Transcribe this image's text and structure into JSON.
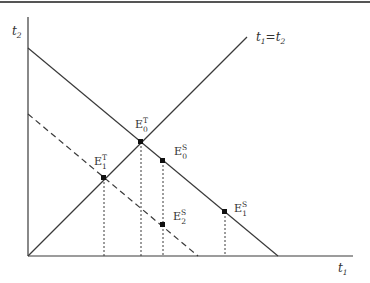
{
  "figure": {
    "type": "economic-diagram",
    "colors": {
      "line": "#3a3a3a",
      "border": "#555555",
      "background": "#ffffff"
    },
    "axes": {
      "x_label": {
        "base": "t",
        "sub": "1"
      },
      "y_label": {
        "base": "t",
        "sub": "2"
      }
    },
    "lines": [
      {
        "id": "diagonal",
        "label_left": {
          "base": "t",
          "sub": "1"
        },
        "label_eq": "=",
        "label_right": {
          "base": "t",
          "sub": "2"
        },
        "style": "solid"
      },
      {
        "id": "budget-line-0",
        "style": "solid"
      },
      {
        "id": "budget-line-1",
        "style": "dashed"
      }
    ],
    "points": [
      {
        "id": "E0T",
        "base": "E",
        "sup": "T",
        "sub": "0"
      },
      {
        "id": "E1T",
        "base": "E",
        "sup": "T",
        "sub": "1"
      },
      {
        "id": "E0S",
        "base": "E",
        "sup": "S",
        "sub": "0"
      },
      {
        "id": "E2S",
        "base": "E",
        "sup": "S",
        "sub": "2"
      },
      {
        "id": "E1S",
        "base": "E",
        "sup": "S",
        "sub": "1"
      }
    ]
  }
}
